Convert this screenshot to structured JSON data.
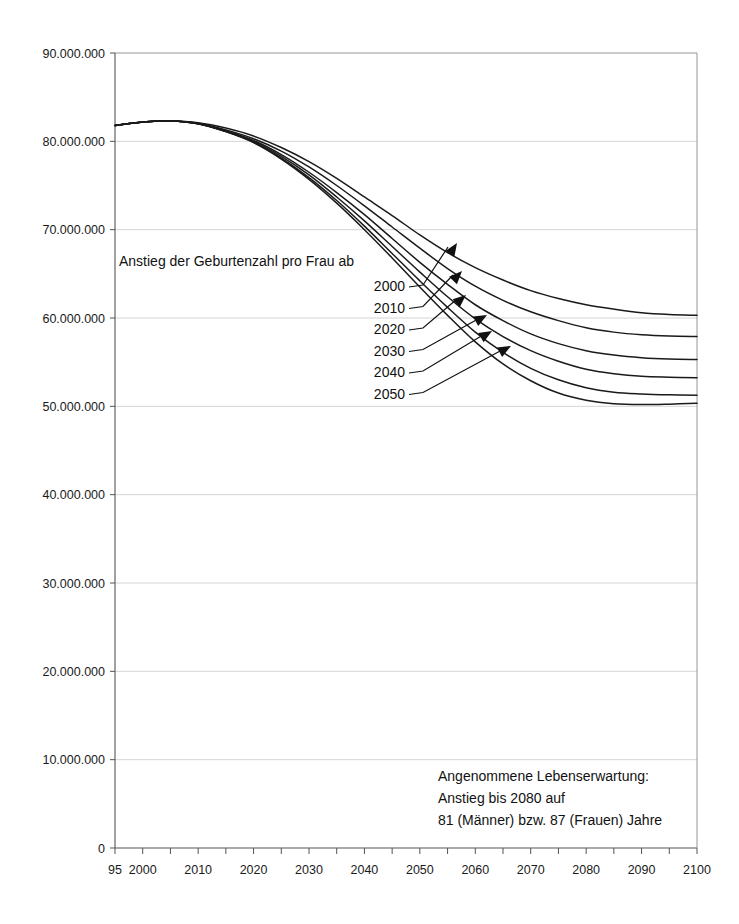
{
  "chart_data": {
    "type": "line",
    "title": "",
    "subtitle": "",
    "xlabel": "",
    "ylabel": "",
    "xlim": [
      1995,
      2100
    ],
    "ylim": [
      0,
      90000000
    ],
    "grid": true,
    "legend_position": "inline-annotation",
    "x_tick_labels": [
      "95",
      "2000",
      "2010",
      "2020",
      "2030",
      "2040",
      "2050",
      "2060",
      "2070",
      "2080",
      "2090",
      "2100"
    ],
    "x_tick_values": [
      1995,
      2000,
      2010,
      2020,
      2030,
      2040,
      2050,
      2060,
      2070,
      2080,
      2090,
      2100
    ],
    "x_minor_tick_step": 5,
    "y_tick_labels": [
      "0",
      "10.000.000",
      "20.000.000",
      "30.000.000",
      "40.000.000",
      "50.000.000",
      "60.000.000",
      "70.000.000",
      "80.000.000",
      "90.000.000"
    ],
    "y_tick_values": [
      0,
      10000000,
      20000000,
      30000000,
      40000000,
      50000000,
      60000000,
      70000000,
      80000000,
      90000000
    ],
    "x": [
      1995,
      2000,
      2005,
      2010,
      2015,
      2020,
      2025,
      2030,
      2035,
      2040,
      2045,
      2050,
      2055,
      2060,
      2065,
      2070,
      2075,
      2080,
      2085,
      2090,
      2095,
      2100
    ],
    "series": [
      {
        "name": "2000",
        "label": "2000",
        "values": [
          81800000,
          82200000,
          82300000,
          82100000,
          81500000,
          80600000,
          79300000,
          77700000,
          75800000,
          73700000,
          71600000,
          69400000,
          67400000,
          65700000,
          64300000,
          63100000,
          62200000,
          61500000,
          61000000,
          60600000,
          60400000,
          60300000
        ]
      },
      {
        "name": "2010",
        "label": "2010",
        "values": [
          81800000,
          82200000,
          82300000,
          82050000,
          81300000,
          80300000,
          78900000,
          77100000,
          75000000,
          72700000,
          70300000,
          67900000,
          65600000,
          63600000,
          62000000,
          60700000,
          59700000,
          58900000,
          58400000,
          58100000,
          57950000,
          57900000
        ]
      },
      {
        "name": "2020",
        "label": "2020",
        "values": [
          81800000,
          82200000,
          82300000,
          82000000,
          81200000,
          80100000,
          78500000,
          76500000,
          74200000,
          71700000,
          69000000,
          66300000,
          63800000,
          61500000,
          59700000,
          58200000,
          57100000,
          56300000,
          55800000,
          55500000,
          55350000,
          55300000
        ]
      },
      {
        "name": "2030",
        "label": "2030",
        "values": [
          81800000,
          82200000,
          82300000,
          82000000,
          81150000,
          80000000,
          78300000,
          76200000,
          73700000,
          71000000,
          68100000,
          65200000,
          62400000,
          59900000,
          57900000,
          56300000,
          55100000,
          54200000,
          53700000,
          53400000,
          53300000,
          53250000
        ]
      },
      {
        "name": "2040",
        "label": "2040",
        "values": [
          81800000,
          82200000,
          82300000,
          82000000,
          81100000,
          79900000,
          78100000,
          75900000,
          73300000,
          70400000,
          67300000,
          64200000,
          61200000,
          58400000,
          56100000,
          54300000,
          53000000,
          52100000,
          51600000,
          51400000,
          51300000,
          51250000
        ]
      },
      {
        "name": "2050",
        "label": "2050",
        "values": [
          81800000,
          82200000,
          82300000,
          82000000,
          81100000,
          79850000,
          78000000,
          75700000,
          73000000,
          70000000,
          66800000,
          63500000,
          60300000,
          57300000,
          54800000,
          52900000,
          51500000,
          50700000,
          50300000,
          50200000,
          50250000,
          50350000
        ]
      }
    ],
    "annotations": [
      {
        "id": "fertility-note",
        "text": "Anstieg der Geburtenzahl pro Frau ab"
      },
      {
        "id": "life-expectancy-note",
        "lines": [
          "Angenommene Lebenserwartung:",
          "Anstieg bis 2080 auf",
          "81 (Männer) bzw. 87 (Frauen) Jahre"
        ]
      }
    ]
  },
  "style": {
    "line_color": "#1a1a1a",
    "grid_color": "#c9c9c9",
    "axis_color": "#555555",
    "background": "#ffffff",
    "text_color": "#1a1a1a"
  }
}
